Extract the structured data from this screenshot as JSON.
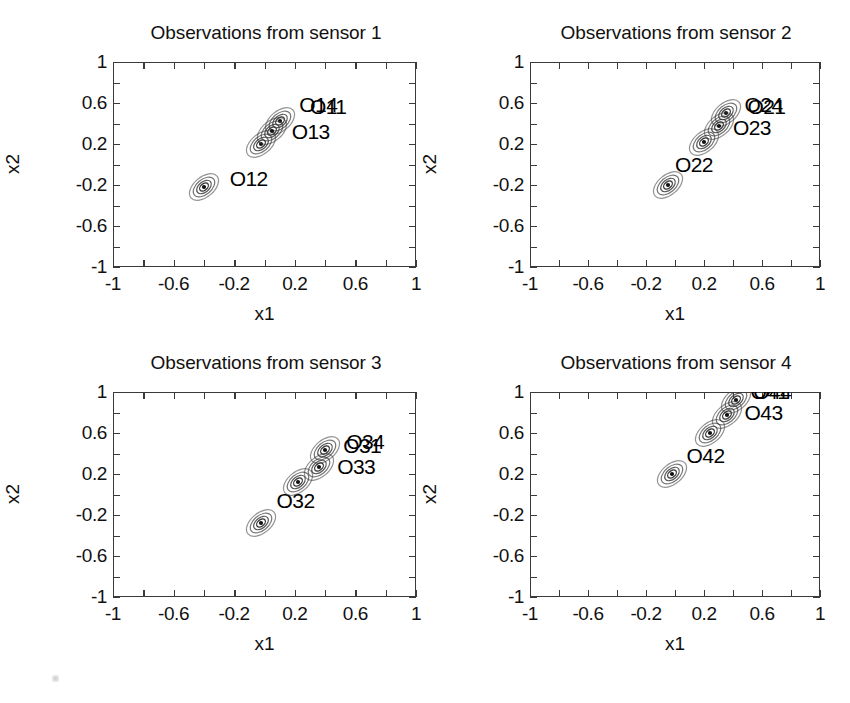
{
  "figure": {
    "layout": "2x2 grid of scatter/contour panels",
    "background": "#ffffff",
    "contour_color": "#3a3a3a",
    "text_color": "#111111"
  },
  "axis": {
    "xlabel": "x1",
    "ylabel": "x2",
    "xticks": [
      "-1",
      "-0.6",
      "-0.2",
      "0.2",
      "0.6",
      "1"
    ],
    "yticks": [
      "1",
      "0.6",
      "0.2",
      "-0.2",
      "-0.6",
      "-1"
    ],
    "xtick_values": [
      -1,
      -0.6,
      -0.2,
      0.2,
      0.6,
      1
    ],
    "ytick_values": [
      1,
      0.6,
      0.2,
      -0.2,
      -0.6,
      -1
    ],
    "xlim": [
      -1,
      1
    ],
    "ylim": [
      -1,
      1
    ]
  },
  "chart_data": {
    "type": "scatter",
    "xlabel": "x1",
    "ylabel": "x2",
    "xlim": [
      -1,
      1
    ],
    "ylim": [
      -1,
      1
    ],
    "grid": false,
    "legend": "none",
    "note": "Each panel plots four observation points, each surrounded by four concentric elliptical density contours tilted along the +45 degree diagonal.",
    "panels": [
      {
        "id": "sensor-1",
        "title": "Observations from sensor 1",
        "points": [
          {
            "label": "O11",
            "x": 0.1,
            "y": 0.42,
            "label_dx": 0.2,
            "label_dy": 0.12
          },
          {
            "label": "O12",
            "x": -0.4,
            "y": -0.22,
            "label_dx": 0.17,
            "label_dy": 0.06
          },
          {
            "label": "O13",
            "x": -0.02,
            "y": 0.2,
            "label_dx": 0.2,
            "label_dy": 0.1
          },
          {
            "label": "O14",
            "x": 0.05,
            "y": 0.33,
            "label_dx": 0.18,
            "label_dy": 0.23
          }
        ]
      },
      {
        "id": "sensor-2",
        "title": "Observations from sensor 2",
        "points": [
          {
            "label": "O21",
            "x": 0.35,
            "y": 0.5,
            "label_dx": 0.15,
            "label_dy": 0.04
          },
          {
            "label": "O22",
            "x": -0.05,
            "y": -0.2,
            "label_dx": 0.05,
            "label_dy": 0.18
          },
          {
            "label": "O23",
            "x": 0.3,
            "y": 0.38,
            "label_dx": 0.1,
            "label_dy": -0.04
          },
          {
            "label": "O24",
            "x": 0.2,
            "y": 0.22,
            "label_dx": 0.28,
            "label_dy": 0.34
          }
        ]
      },
      {
        "id": "sensor-3",
        "title": "Observations from sensor 3",
        "points": [
          {
            "label": "O31",
            "x": 0.4,
            "y": 0.43,
            "label_dx": 0.12,
            "label_dy": 0.02
          },
          {
            "label": "O32",
            "x": -0.02,
            "y": -0.28,
            "label_dx": 0.1,
            "label_dy": 0.2
          },
          {
            "label": "O33",
            "x": 0.36,
            "y": 0.27,
            "label_dx": 0.12,
            "label_dy": -0.02
          },
          {
            "label": "O34",
            "x": 0.22,
            "y": 0.12,
            "label_dx": 0.32,
            "label_dy": 0.37
          }
        ]
      },
      {
        "id": "sensor-4",
        "title": "Observations from sensor 4",
        "points": [
          {
            "label": "O41",
            "x": 0.42,
            "y": 0.92,
            "label_dx": 0.1,
            "label_dy": 0.06
          },
          {
            "label": "O42",
            "x": -0.02,
            "y": 0.2,
            "label_dx": 0.1,
            "label_dy": 0.16
          },
          {
            "label": "O43",
            "x": 0.36,
            "y": 0.78,
            "label_dx": 0.12,
            "label_dy": 0.0
          },
          {
            "label": "O44",
            "x": 0.24,
            "y": 0.6,
            "label_dx": 0.3,
            "label_dy": 0.38
          }
        ]
      }
    ]
  }
}
